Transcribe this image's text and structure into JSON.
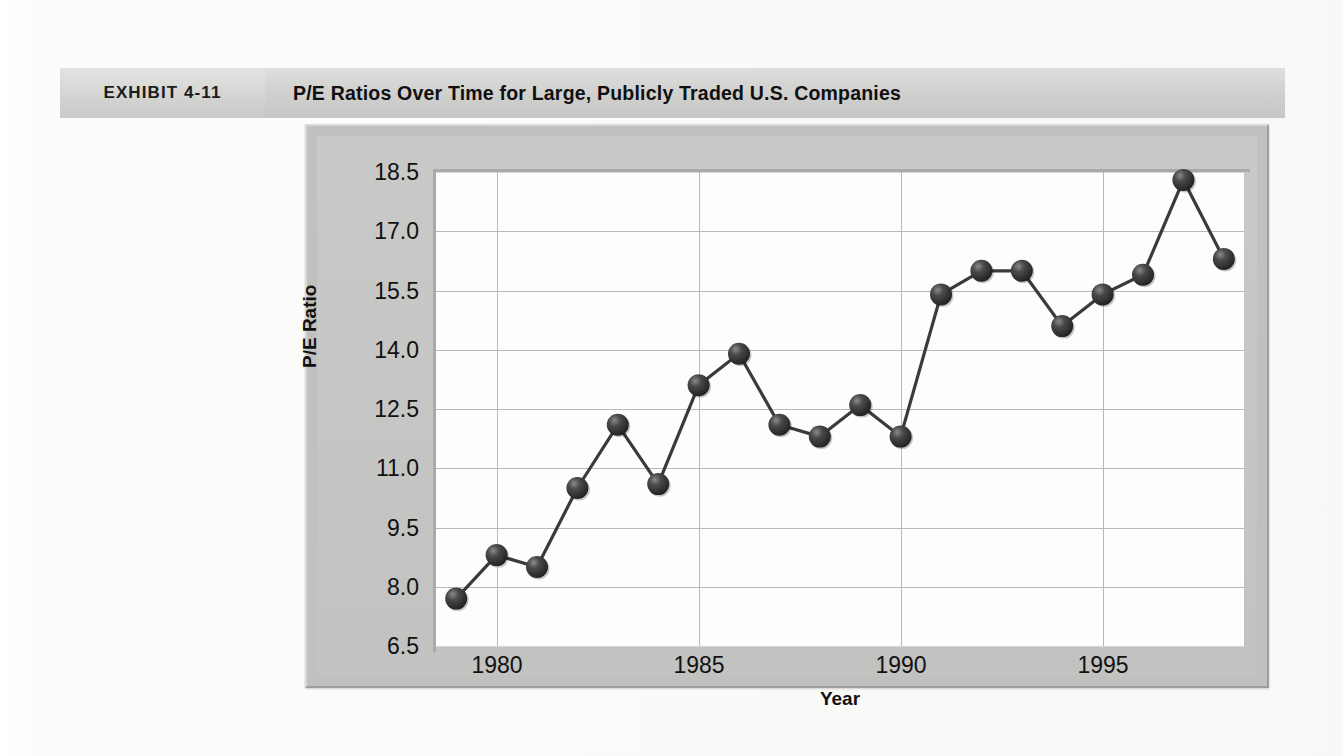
{
  "exhibit": {
    "tag": "EXHIBIT 4-11",
    "title": "P/E Ratios Over Time for Large, Publicly Traded U.S. Companies"
  },
  "chart_data": {
    "type": "line",
    "title": "P/E Ratios Over Time for Large, Publicly Traded U.S. Companies",
    "xlabel": "Year",
    "ylabel": "P/E Ratio",
    "grid": true,
    "legend": "none",
    "marker": "filled-circle-3d",
    "xlim": [
      1978.5,
      1998.5
    ],
    "ylim": [
      6.5,
      18.5
    ],
    "ytick_labels": [
      "6.5",
      "8.0",
      "9.5",
      "11.0",
      "12.5",
      "14.0",
      "15.5",
      "17.0",
      "18.5"
    ],
    "yticks": [
      6.5,
      8.0,
      9.5,
      11.0,
      12.5,
      14.0,
      15.5,
      17.0,
      18.5
    ],
    "xtick_labels": [
      "1980",
      "1985",
      "1990",
      "1995"
    ],
    "xticks": [
      1980,
      1985,
      1990,
      1995
    ],
    "x": [
      1979,
      1980,
      1981,
      1982,
      1983,
      1984,
      1985,
      1986,
      1987,
      1988,
      1989,
      1990,
      1991,
      1992,
      1993,
      1994,
      1995,
      1996,
      1997,
      1998
    ],
    "values": [
      7.7,
      8.8,
      8.5,
      10.5,
      12.1,
      10.6,
      13.1,
      13.9,
      12.1,
      11.8,
      12.6,
      11.8,
      15.4,
      16.0,
      16.0,
      14.6,
      15.4,
      15.9,
      18.3,
      16.3
    ],
    "series": [
      {
        "name": "P/E Ratio",
        "values": [
          7.7,
          8.8,
          8.5,
          10.5,
          12.1,
          10.6,
          13.1,
          13.9,
          12.1,
          11.8,
          12.6,
          11.8,
          15.4,
          16.0,
          16.0,
          14.6,
          15.4,
          15.9,
          18.3,
          16.3
        ]
      }
    ],
    "colors": {
      "line": "#3a3a3a",
      "marker": "#2e2e2e",
      "plot_background": "#fdfdfd",
      "panel_background": "#c4c4c2",
      "grid": "#b9b9b9",
      "header_band": "#cfcfcd"
    }
  }
}
